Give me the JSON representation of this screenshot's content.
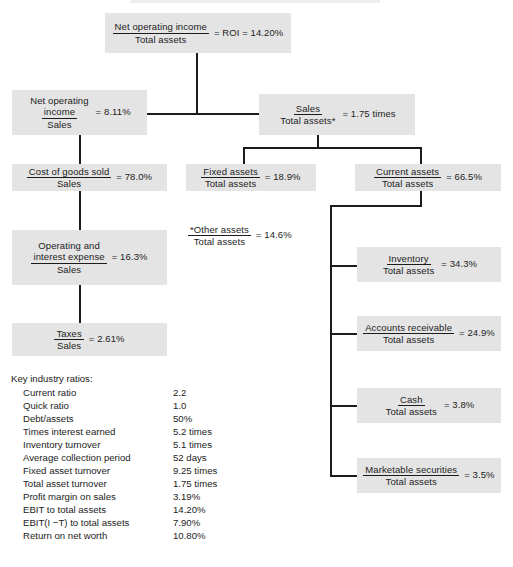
{
  "diagram": {
    "nodes": {
      "roi": {
        "numerator": "Net operating income",
        "denominator": "Total assets",
        "result": "= ROI = 14.20%"
      },
      "profit_margin": {
        "numerator_line1": "Net operating",
        "numerator_line2": "income",
        "denominator": "Sales",
        "result": "= 8.11%"
      },
      "asset_turnover": {
        "numerator": "Sales",
        "denominator": "Total assets*",
        "result": "= 1.75 times"
      },
      "cogs": {
        "numerator": "Cost of goods sold",
        "denominator": "Sales",
        "result": "= 78.0%"
      },
      "fixed_assets": {
        "numerator": "Fixed assets",
        "denominator": "Total assets",
        "result": "= 18.9%"
      },
      "current_assets": {
        "numerator": "Current assets",
        "denominator": "Total assets",
        "result": "= 66.5%"
      },
      "operating_interest": {
        "numerator_line1": "Operating and",
        "numerator_line2": "interest expense",
        "denominator": "Sales",
        "result": "= 16.3%"
      },
      "taxes": {
        "numerator": "Taxes",
        "denominator": "Sales",
        "result": "= 2.61%"
      },
      "inventory": {
        "numerator": "Inventory",
        "denominator": "Total assets",
        "result": "= 34.3%"
      },
      "accounts_receivable": {
        "numerator": "Accounts receivable",
        "denominator": "Total assets",
        "result": "= 24.9%"
      },
      "cash": {
        "numerator": "Cash",
        "denominator": "Total assets",
        "result": "= 3.8%"
      },
      "marketable_securities": {
        "numerator": "Marketable securities",
        "denominator": "Total assets",
        "result": "= 3.5%"
      }
    },
    "footnote": {
      "numerator": "*Other assets",
      "denominator": "Total assets",
      "result": "= 14.6%"
    }
  },
  "ratios": {
    "title": "Key industry ratios:",
    "rows": [
      {
        "name": "Current ratio",
        "value": "2.2"
      },
      {
        "name": "Quick ratio",
        "value": "1.0"
      },
      {
        "name": "Debt/assets",
        "value": "50%"
      },
      {
        "name": "Times interest earned",
        "value": "5.2 times"
      },
      {
        "name": "Inventory turnover",
        "value": "5.1 times"
      },
      {
        "name": "Average collection period",
        "value": "52 days"
      },
      {
        "name": "Fixed asset turnover",
        "value": "9.25 times"
      },
      {
        "name": "Total asset turnover",
        "value": "1.75 times"
      },
      {
        "name": "Profit margin on sales",
        "value": "3.19%"
      },
      {
        "name": "EBIT to total assets",
        "value": "14.20%"
      },
      {
        "name": "EBIT(I −T) to total assets",
        "value": "7.90%"
      },
      {
        "name": "Return on net worth",
        "value": "10.80%"
      }
    ]
  },
  "colors": {
    "box_fill": "#e4e4e4",
    "line": "#1c1c1c",
    "text": "#1c1c1c",
    "page_background": "#ffffff"
  }
}
